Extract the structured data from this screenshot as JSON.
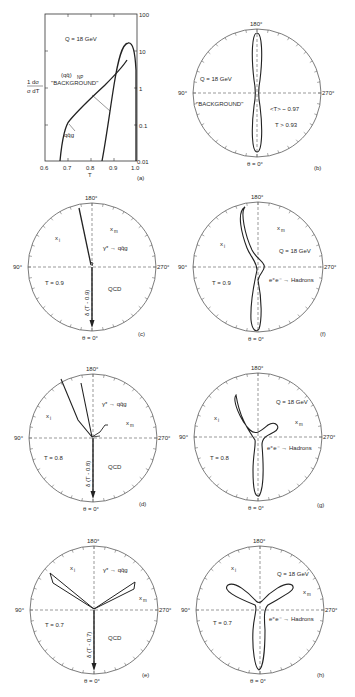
{
  "figure": {
    "panels": [
      {
        "id": "a",
        "label": "(a)",
        "type": "log-plot",
        "energy": "Q = 18 GeV",
        "ylabel": "1/σ dσ/dT",
        "xlabel": "T",
        "xticks": [
          "0.6",
          "0.7",
          "0.8",
          "0.9",
          "1.0"
        ],
        "yticks": [
          "100",
          "10",
          "1",
          "0.1",
          "0.01"
        ],
        "curves": [
          {
            "name": "(qq̄)NP \"BACKGROUND\"",
            "label_main": "(qq̄)",
            "label_sub": "NP",
            "label_bg": "\"BACKGROUND\""
          },
          {
            "name": "qq̄g",
            "label": "qq̄g"
          }
        ]
      },
      {
        "id": "b",
        "label": "(b)",
        "type": "polar",
        "top": "180°",
        "bottom": "θ = 0°",
        "left": "90°",
        "right": "270°",
        "texts": [
          "Q = 18 GeV",
          "\"BACKGROUND\"",
          "<T> ~ 0.97",
          "T > 0.93"
        ]
      },
      {
        "id": "c",
        "label": "(c)",
        "type": "polar",
        "top": "180°",
        "bottom": "θ = 0°",
        "left": "90°",
        "right": "270°",
        "texts": {
          "xi": "x",
          "xi_sub": "i",
          "xm": "x",
          "xm_sub": "m",
          "process": "γ* → qq̄g",
          "thrust": "T = 0.9",
          "model": "QCD",
          "delta": "δ (T - 0.9)"
        }
      },
      {
        "id": "d",
        "label": "(d)",
        "type": "polar",
        "top": "180°",
        "bottom": "θ = 0°",
        "left": "90°",
        "right": "270°",
        "texts": {
          "xi": "x",
          "xi_sub": "i",
          "xm": "x",
          "xm_sub": "m",
          "process": "γ* → qq̄g",
          "thrust": "T = 0.8",
          "model": "QCD",
          "delta": "δ (T - 0.8)"
        }
      },
      {
        "id": "e",
        "label": "(e)",
        "type": "polar",
        "top": "180°",
        "bottom": "θ = 0°",
        "left": "90°",
        "right": "270°",
        "texts": {
          "xi": "x",
          "xi_sub": "i",
          "xm": "x",
          "xm_sub": "m",
          "process": "γ* → qq̄g",
          "thrust": "T = 0.7",
          "model": "QCD",
          "delta": "δ (T - 0.7)"
        }
      },
      {
        "id": "f",
        "label": "(f)",
        "type": "polar",
        "top": "180°",
        "bottom": "θ = 0°",
        "left": "90°",
        "right": "270°",
        "texts": {
          "xi": "x",
          "xi_sub": "i",
          "xm": "x",
          "xm_sub": "m",
          "energy": "Q = 18 GeV",
          "thrust": "T = 0.9",
          "process": "e⁺e⁻ → Hadrons"
        }
      },
      {
        "id": "g",
        "label": "(g)",
        "type": "polar",
        "top": "180°",
        "bottom": "θ = 0°",
        "left": "90°",
        "right": "270°",
        "texts": {
          "xi": "x",
          "xi_sub": "i",
          "xm": "x",
          "xm_sub": "m",
          "energy": "Q = 18 GeV",
          "thrust": "T = 0.8",
          "process": "e⁺e⁻ → Hadrons"
        }
      },
      {
        "id": "h",
        "label": "(h)",
        "type": "polar",
        "top": "180°",
        "bottom": "θ = 0°",
        "left": "90°",
        "right": "270°",
        "texts": {
          "xi": "x",
          "xi_sub": "i",
          "xm": "x",
          "xm_sub": "m",
          "energy": "Q = 18 GeV",
          "thrust": "T = 0.7",
          "process": "e⁺e⁻ → Hadrons"
        }
      }
    ]
  }
}
